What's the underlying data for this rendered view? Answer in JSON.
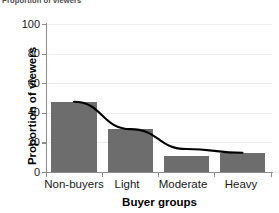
{
  "caption": {
    "fragment": "Proportion of viewers"
  },
  "chart_data": {
    "type": "bar",
    "title": "",
    "xlabel": "Buyer groups",
    "ylabel": "Proportion of viewers",
    "categories": [
      "Non-buyers",
      "Light",
      "Moderate",
      "Heavy"
    ],
    "values": [
      47,
      29,
      11,
      13
    ],
    "ylim": [
      0,
      100
    ],
    "yticks": [
      0,
      20,
      40,
      60,
      80,
      100
    ],
    "ytick_labels": [
      "0",
      "20",
      "40",
      "60",
      "80",
      "100"
    ],
    "grid": true,
    "legend": "none",
    "bar_color": "#6d6d6d",
    "series": [
      {
        "name": "Proportion of viewers",
        "type": "bar",
        "values": [
          47,
          29,
          11,
          13
        ]
      },
      {
        "name": "trend curve",
        "type": "line",
        "color": "#000000",
        "values": [
          47.5,
          29.0,
          15.5,
          13.0
        ]
      }
    ],
    "annotations": []
  }
}
